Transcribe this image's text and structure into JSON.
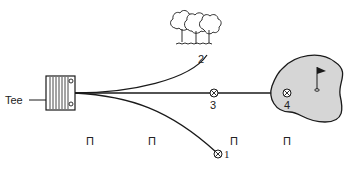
{
  "diagram": {
    "type": "golf-shot-outcomes",
    "tee_label": "Tee",
    "outcomes": [
      {
        "id": "1",
        "label": "1",
        "description": "shot ending right of fairway, lower marker"
      },
      {
        "id": "2",
        "label": "2",
        "description": "shot ending at trees"
      },
      {
        "id": "3",
        "label": "3",
        "description": "shot ending short on centre line"
      },
      {
        "id": "4",
        "label": "4",
        "description": "shot ending on green"
      }
    ],
    "markers": [
      "Π",
      "Π",
      "Π",
      "Π"
    ],
    "colors": {
      "line": "#1a1a1a",
      "green_fill": "#d6d6d6",
      "background": "#ffffff"
    }
  }
}
